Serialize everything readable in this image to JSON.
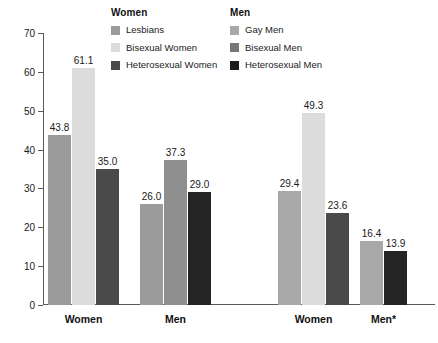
{
  "legends": [
    {
      "name": "women-legend",
      "title": "Women",
      "items": [
        {
          "label": "Lesbians",
          "color": "#9b9b9b"
        },
        {
          "label": "Bisexual Women",
          "color": "#dcdcdc"
        },
        {
          "label": "Heterosexual Women",
          "color": "#4a4a4a"
        }
      ]
    },
    {
      "name": "men-legend",
      "title": "Men",
      "items": [
        {
          "label": "Gay Men",
          "color": "#a8a8a8"
        },
        {
          "label": "Bisexual Men",
          "color": "#777777"
        },
        {
          "label": "Heterosexual Men",
          "color": "#1c1c1c"
        }
      ]
    }
  ],
  "chart_data": {
    "type": "bar",
    "title": "",
    "xlabel": "",
    "ylabel": "",
    "ylim": [
      0,
      70
    ],
    "yticks": [
      0,
      10,
      20,
      30,
      40,
      50,
      60,
      70
    ],
    "grid": false,
    "legend_position": "top",
    "categories": [
      "Women",
      "Men",
      "Women",
      "Men*"
    ],
    "groups": [
      {
        "category": "Women",
        "panel": "Women",
        "bars": [
          {
            "series": "Lesbians",
            "value": 43.8,
            "label": "43.8",
            "color": "#9b9b9b"
          },
          {
            "series": "Bisexual Women",
            "value": 61.1,
            "label": "61.1",
            "color": "#dcdcdc"
          },
          {
            "series": "Heterosexual Women",
            "value": 35.0,
            "label": "35.0",
            "color": "#4a4a4a"
          }
        ]
      },
      {
        "category": "Men",
        "panel": "Women",
        "bars": [
          {
            "series": "Lesbians",
            "value": 26.0,
            "label": "26.0",
            "color": "#9b9b9b"
          },
          {
            "series": "Bisexual Women",
            "value": 37.3,
            "label": "37.3",
            "color": "#8f8f8f"
          },
          {
            "series": "Heterosexual Women",
            "value": 29.0,
            "label": "29.0",
            "color": "#242424"
          }
        ]
      },
      {
        "category": "Women",
        "panel": "Men",
        "bars": [
          {
            "series": "Gay Men",
            "value": 29.4,
            "label": "29.4",
            "color": "#a8a8a8"
          },
          {
            "series": "Bisexual Men",
            "value": 49.3,
            "label": "49.3",
            "color": "#dcdcdc"
          },
          {
            "series": "Heterosexual Men",
            "value": 23.6,
            "label": "23.6",
            "color": "#4a4a4a"
          }
        ]
      },
      {
        "category": "Men*",
        "panel": "Men",
        "bars": [
          {
            "series": "Gay Men",
            "value": 16.4,
            "label": "16.4",
            "color": "#a8a8a8"
          },
          {
            "series": "Heterosexual Men",
            "value": 13.9,
            "label": "13.9",
            "color": "#242424"
          }
        ]
      }
    ]
  },
  "layout": {
    "group_left_px": [
      5,
      97,
      235,
      317
    ],
    "bar_width_px": 23,
    "bar_gap_px": 1
  }
}
